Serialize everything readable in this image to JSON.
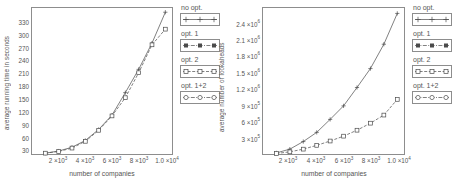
{
  "chart_data": [
    {
      "type": "line",
      "panel": "left",
      "title": "",
      "xlabel": "number of companies",
      "ylabel": "average running time in seconds",
      "xlim": [
        0,
        10500
      ],
      "ylim": [
        0,
        345
      ],
      "grid": false,
      "legend_position": "right",
      "xticks": [
        {
          "value": 2000,
          "label": "2",
          "mantissa": "2 ×10",
          "exp": "3"
        },
        {
          "value": 4000,
          "label": "4",
          "mantissa": "4 ×10",
          "exp": "3"
        },
        {
          "value": 6000,
          "label": "6",
          "mantissa": "6 ×10",
          "exp": "3"
        },
        {
          "value": 8000,
          "label": "8",
          "mantissa": "8 ×10",
          "exp": "3"
        },
        {
          "value": 10000,
          "label": "1.0",
          "mantissa": "1.0 ×10",
          "exp": "4"
        }
      ],
      "yticks": [
        {
          "value": 30,
          "label": "30"
        },
        {
          "value": 60,
          "label": "60"
        },
        {
          "value": 90,
          "label": "90"
        },
        {
          "value": 120,
          "label": "120"
        },
        {
          "value": 150,
          "label": "150"
        },
        {
          "value": 180,
          "label": "180"
        },
        {
          "value": 210,
          "label": "210"
        },
        {
          "value": 240,
          "label": "240"
        },
        {
          "value": 270,
          "label": "270"
        },
        {
          "value": 300,
          "label": "300"
        },
        {
          "value": 330,
          "label": "330"
        }
      ],
      "x": [
        1000,
        2000,
        3000,
        4000,
        5000,
        6000,
        7000,
        8000,
        9000,
        10000
      ],
      "series": [
        {
          "name": "no opt.",
          "values": [
            2,
            7,
            16,
            32,
            58,
            92,
            145,
            200,
            262,
            335
          ]
        },
        {
          "name": "opt. 1",
          "values": [
            2,
            7,
            16,
            32,
            58,
            92,
            145,
            200,
            262,
            335
          ]
        },
        {
          "name": "opt. 2",
          "values": [
            2,
            6,
            14,
            30,
            56,
            90,
            133,
            192,
            258,
            295
          ]
        },
        {
          "name": "opt. 1+2",
          "values": [
            2,
            6,
            14,
            30,
            56,
            90,
            133,
            192,
            258,
            295
          ]
        }
      ]
    },
    {
      "type": "line",
      "panel": "right",
      "title": "",
      "xlabel": "number of companies",
      "ylabel": "average number of lookaheads",
      "xlim": [
        0,
        10500
      ],
      "ylim": [
        0,
        2700000
      ],
      "grid": false,
      "legend_position": "right",
      "xticks": [
        {
          "value": 2000,
          "label": "2",
          "mantissa": "2 ×10",
          "exp": "3"
        },
        {
          "value": 4000,
          "label": "4",
          "mantissa": "4 ×10",
          "exp": "3"
        },
        {
          "value": 6000,
          "label": "6",
          "mantissa": "6 ×10",
          "exp": "3"
        },
        {
          "value": 8000,
          "label": "8",
          "mantissa": "8 ×10",
          "exp": "3"
        },
        {
          "value": 10000,
          "label": "1.0",
          "mantissa": "1.0 ×10",
          "exp": "4"
        }
      ],
      "yticks": [
        {
          "value": 300000,
          "mantissa": "3 ×10",
          "exp": "5"
        },
        {
          "value": 600000,
          "mantissa": "6 ×10",
          "exp": "5"
        },
        {
          "value": 900000,
          "mantissa": "9 ×10",
          "exp": "5"
        },
        {
          "value": 1200000,
          "mantissa": "1.2 ×10",
          "exp": "6"
        },
        {
          "value": 1500000,
          "mantissa": "1.5 ×10",
          "exp": "6"
        },
        {
          "value": 1800000,
          "mantissa": "1.8 ×10",
          "exp": "6"
        },
        {
          "value": 2100000,
          "mantissa": "2.1 ×10",
          "exp": "6"
        },
        {
          "value": 2400000,
          "mantissa": "2.4 ×10",
          "exp": "6"
        }
      ],
      "x": [
        1000,
        2000,
        3000,
        4000,
        5000,
        6000,
        7000,
        8000,
        9000,
        10000
      ],
      "series": [
        {
          "name": "no opt.",
          "values": [
            20000,
            90000,
            230000,
            400000,
            640000,
            890000,
            1230000,
            1580000,
            2030000,
            2600000
          ]
        },
        {
          "name": "opt. 1",
          "values": [
            20000,
            90000,
            230000,
            400000,
            640000,
            890000,
            1230000,
            1580000,
            2030000,
            2600000
          ]
        },
        {
          "name": "opt. 2",
          "values": [
            10000,
            40000,
            90000,
            160000,
            240000,
            330000,
            440000,
            570000,
            720000,
            1010000
          ]
        },
        {
          "name": "opt. 1+2",
          "values": [
            10000,
            40000,
            90000,
            160000,
            240000,
            330000,
            440000,
            570000,
            720000,
            1010000
          ]
        }
      ]
    }
  ],
  "legend": {
    "entries": [
      {
        "label": "no opt.",
        "marker": "plus",
        "line": "solid"
      },
      {
        "label": "opt. 1",
        "marker": "square-filled",
        "line": "dashdot"
      },
      {
        "label": "opt. 2",
        "marker": "square-open",
        "line": "dashed"
      },
      {
        "label": "opt. 1+2",
        "marker": "circle-open",
        "line": "dashdot"
      }
    ]
  },
  "colors": {
    "axis": "#8d8d8d",
    "text": "#555555",
    "curve": "#4b4b4b",
    "background": "#ffffff"
  }
}
